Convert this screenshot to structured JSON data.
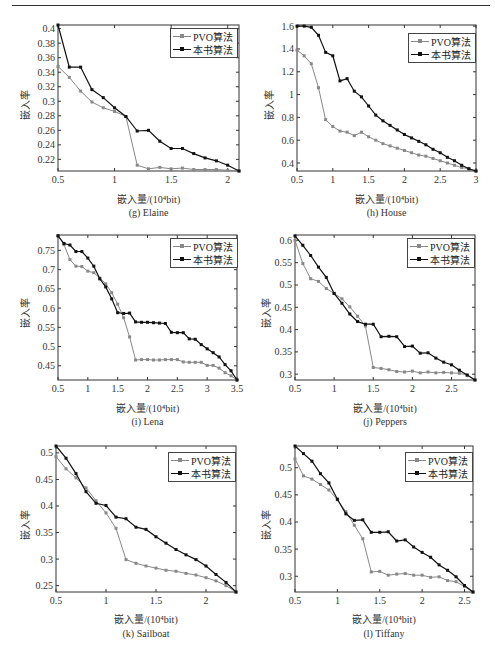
{
  "page": {
    "top_rule": true
  },
  "common": {
    "xlabel": "嵌入量/(10⁴bit)",
    "ylabel": "嵌入率",
    "legend": [
      "PVO算法",
      "本书算法"
    ],
    "colors": {
      "pvo": "#888888",
      "ours": "#111111"
    }
  },
  "chart_data": [
    {
      "id": "elaine",
      "type": "line",
      "title": "(g) Elaine",
      "xlabel": "嵌入量/(10⁴bit)",
      "ylabel": "嵌入率",
      "xlim": [
        0.5,
        2.1
      ],
      "ylim": [
        0.204,
        0.405
      ],
      "xticks": [
        0.5,
        1,
        1.5,
        2
      ],
      "xtick_labels": [
        "0.5",
        "1",
        "1.5",
        "2"
      ],
      "yticks": [
        0.22,
        0.24,
        0.26,
        0.28,
        0.3,
        0.32,
        0.34,
        0.36,
        0.38,
        0.4
      ],
      "ytick_labels": [
        "0.22",
        "0.24",
        "0.26",
        "0.28",
        "0.3",
        "0.32",
        "0.34",
        "0.36",
        "0.38",
        "0.4"
      ],
      "legend_position": "upper right",
      "grid": false,
      "x": [
        0.5,
        0.6,
        0.7,
        0.8,
        0.9,
        1.0,
        1.1,
        1.2,
        1.3,
        1.4,
        1.5,
        1.6,
        1.7,
        1.8,
        1.9,
        2.0,
        2.1
      ],
      "series": [
        {
          "name": "PVO算法",
          "values": [
            0.348,
            0.333,
            0.314,
            0.299,
            0.291,
            0.286,
            0.279,
            0.212,
            0.207,
            0.209,
            0.207,
            0.208,
            0.206,
            0.206,
            0.206,
            0.205,
            0.204
          ]
        },
        {
          "name": "本书算法",
          "values": [
            0.405,
            0.347,
            0.347,
            0.316,
            0.305,
            0.291,
            0.279,
            0.259,
            0.26,
            0.245,
            0.235,
            0.235,
            0.228,
            0.222,
            0.218,
            0.212,
            0.204
          ]
        }
      ]
    },
    {
      "id": "house",
      "type": "line",
      "title": "(h) House",
      "xlabel": "嵌入量/(10⁴bit)",
      "ylabel": "嵌入率",
      "xlim": [
        0.5,
        3.0
      ],
      "ylim": [
        0.33,
        1.61
      ],
      "xticks": [
        0.5,
        1,
        1.5,
        2,
        2.5,
        3
      ],
      "xtick_labels": [
        "0.5",
        "1",
        "1.5",
        "2",
        "2.5",
        "3"
      ],
      "yticks": [
        0.4,
        0.6,
        0.8,
        1.0,
        1.2,
        1.4,
        1.6
      ],
      "ytick_labels": [
        "0.4",
        "0.6",
        "0.8",
        "1",
        "1.2",
        "1.4",
        "1.6"
      ],
      "legend_position": "upper right",
      "grid": false,
      "x": [
        0.5,
        0.6,
        0.7,
        0.8,
        0.9,
        1.0,
        1.1,
        1.2,
        1.3,
        1.4,
        1.5,
        1.6,
        1.7,
        1.8,
        1.9,
        2.0,
        2.1,
        2.2,
        2.3,
        2.4,
        2.5,
        2.6,
        2.7,
        2.8,
        2.9,
        3.0
      ],
      "series": [
        {
          "name": "PVO算法",
          "values": [
            1.39,
            1.34,
            1.27,
            1.06,
            0.78,
            0.72,
            0.68,
            0.67,
            0.64,
            0.67,
            0.63,
            0.6,
            0.57,
            0.55,
            0.53,
            0.51,
            0.49,
            0.47,
            0.46,
            0.44,
            0.42,
            0.4,
            0.38,
            0.36,
            0.35,
            0.33
          ]
        },
        {
          "name": "本书算法",
          "values": [
            1.6,
            1.6,
            1.59,
            1.52,
            1.37,
            1.34,
            1.12,
            1.14,
            1.03,
            0.98,
            0.9,
            0.82,
            0.77,
            0.73,
            0.69,
            0.65,
            0.62,
            0.59,
            0.56,
            0.52,
            0.49,
            0.45,
            0.42,
            0.38,
            0.35,
            0.33
          ]
        }
      ]
    },
    {
      "id": "lena",
      "type": "line",
      "title": "(i) Lena",
      "xlabel": "嵌入量/(10⁴bit)",
      "ylabel": "嵌入率",
      "xlim": [
        0.5,
        3.5
      ],
      "ylim": [
        0.413,
        0.79
      ],
      "xticks": [
        0.5,
        1,
        1.5,
        2,
        2.5,
        3,
        3.5
      ],
      "xtick_labels": [
        "0.5",
        "1",
        "1.5",
        "2",
        "2.5",
        "3",
        "3.5"
      ],
      "yticks": [
        0.45,
        0.5,
        0.55,
        0.6,
        0.65,
        0.7,
        0.75
      ],
      "ytick_labels": [
        "0.45",
        "0.5",
        "0.55",
        "0.6",
        "0.65",
        "0.7",
        "0.75"
      ],
      "legend_position": "upper right",
      "grid": false,
      "x": [
        0.5,
        0.6,
        0.7,
        0.8,
        0.9,
        1.0,
        1.1,
        1.2,
        1.3,
        1.4,
        1.5,
        1.6,
        1.7,
        1.8,
        1.9,
        2.0,
        2.1,
        2.2,
        2.3,
        2.4,
        2.5,
        2.6,
        2.7,
        2.8,
        2.9,
        3.0,
        3.1,
        3.2,
        3.3,
        3.4,
        3.5
      ],
      "series": [
        {
          "name": "PVO算法",
          "values": [
            0.788,
            0.765,
            0.726,
            0.709,
            0.708,
            0.696,
            0.692,
            0.678,
            0.663,
            0.64,
            0.61,
            0.575,
            0.525,
            0.465,
            0.466,
            0.466,
            0.465,
            0.465,
            0.466,
            0.466,
            0.466,
            0.46,
            0.459,
            0.459,
            0.459,
            0.451,
            0.451,
            0.444,
            0.432,
            0.424,
            0.413
          ]
        },
        {
          "name": "本书算法",
          "values": [
            0.788,
            0.768,
            0.764,
            0.747,
            0.747,
            0.73,
            0.709,
            0.676,
            0.655,
            0.624,
            0.588,
            0.586,
            0.587,
            0.564,
            0.563,
            0.563,
            0.562,
            0.561,
            0.56,
            0.537,
            0.536,
            0.536,
            0.52,
            0.519,
            0.505,
            0.494,
            0.484,
            0.473,
            0.453,
            0.437,
            0.413
          ]
        }
      ]
    },
    {
      "id": "peppers",
      "type": "line",
      "title": "(j) Peppers",
      "xlabel": "嵌入量/(10⁴bit)",
      "ylabel": "嵌入率",
      "xlim": [
        0.5,
        2.8
      ],
      "ylim": [
        0.287,
        0.612
      ],
      "xticks": [
        0.5,
        1,
        1.5,
        2,
        2.5
      ],
      "xtick_labels": [
        "0.5",
        "1",
        "1.5",
        "2",
        "2.5"
      ],
      "yticks": [
        0.3,
        0.35,
        0.4,
        0.45,
        0.5,
        0.55,
        0.6
      ],
      "ytick_labels": [
        "0.3",
        "0.35",
        "0.4",
        "0.45",
        "0.5",
        "0.55",
        "0.6"
      ],
      "legend_position": "upper right",
      "grid": false,
      "x": [
        0.5,
        0.6,
        0.7,
        0.8,
        0.9,
        1.0,
        1.1,
        1.2,
        1.3,
        1.4,
        1.5,
        1.6,
        1.7,
        1.8,
        1.9,
        2.0,
        2.1,
        2.2,
        2.3,
        2.4,
        2.5,
        2.6,
        2.7,
        2.8
      ],
      "series": [
        {
          "name": "PVO算法",
          "values": [
            0.6,
            0.548,
            0.514,
            0.508,
            0.492,
            0.481,
            0.469,
            0.451,
            0.43,
            0.408,
            0.315,
            0.313,
            0.31,
            0.306,
            0.305,
            0.307,
            0.303,
            0.305,
            0.303,
            0.304,
            0.303,
            0.302,
            0.298,
            0.287
          ]
        },
        {
          "name": "本书算法",
          "values": [
            0.61,
            0.589,
            0.566,
            0.54,
            0.517,
            0.481,
            0.459,
            0.435,
            0.418,
            0.412,
            0.412,
            0.384,
            0.385,
            0.384,
            0.362,
            0.363,
            0.347,
            0.348,
            0.336,
            0.327,
            0.321,
            0.309,
            0.298,
            0.287
          ]
        }
      ]
    },
    {
      "id": "sailboat",
      "type": "line",
      "title": "(k) Sailboat",
      "xlabel": "嵌入量/(10⁴bit)",
      "ylabel": "嵌入率",
      "xlim": [
        0.5,
        2.3
      ],
      "ylim": [
        0.238,
        0.513
      ],
      "xticks": [
        0.5,
        1,
        1.5,
        2
      ],
      "xtick_labels": [
        "0.5",
        "1",
        "1.5",
        "2"
      ],
      "yticks": [
        0.25,
        0.3,
        0.35,
        0.4,
        0.45,
        0.5
      ],
      "ytick_labels": [
        "0.25",
        "0.3",
        "0.35",
        "0.4",
        "0.45",
        "0.5"
      ],
      "legend_position": "upper right",
      "grid": false,
      "x": [
        0.5,
        0.6,
        0.7,
        0.8,
        0.9,
        1.0,
        1.1,
        1.2,
        1.3,
        1.4,
        1.5,
        1.6,
        1.7,
        1.8,
        1.9,
        2.0,
        2.1,
        2.2,
        2.3
      ],
      "series": [
        {
          "name": "PVO算法",
          "values": [
            0.493,
            0.47,
            0.453,
            0.434,
            0.41,
            0.387,
            0.358,
            0.299,
            0.292,
            0.287,
            0.283,
            0.279,
            0.277,
            0.273,
            0.27,
            0.265,
            0.259,
            0.25,
            0.238
          ]
        },
        {
          "name": "本书算法",
          "values": [
            0.513,
            0.49,
            0.461,
            0.427,
            0.405,
            0.401,
            0.379,
            0.376,
            0.36,
            0.356,
            0.342,
            0.33,
            0.318,
            0.308,
            0.299,
            0.287,
            0.271,
            0.256,
            0.238
          ]
        }
      ]
    },
    {
      "id": "tiffany",
      "type": "line",
      "title": "(l) Tiffany",
      "xlabel": "嵌入量/(10⁴bit)",
      "ylabel": "嵌入率",
      "xlim": [
        0.5,
        2.6
      ],
      "ylim": [
        0.271,
        0.54
      ],
      "xticks": [
        0.5,
        1,
        1.5,
        2,
        2.5
      ],
      "xtick_labels": [
        "0.5",
        "1",
        "1.5",
        "2",
        "2.5"
      ],
      "yticks": [
        0.3,
        0.35,
        0.4,
        0.45,
        0.5
      ],
      "ytick_labels": [
        "0.3",
        "0.35",
        "0.4",
        "0.45",
        "0.5"
      ],
      "legend_position": "upper right",
      "grid": false,
      "x": [
        0.5,
        0.6,
        0.7,
        0.8,
        0.9,
        1.0,
        1.1,
        1.2,
        1.3,
        1.4,
        1.5,
        1.6,
        1.7,
        1.8,
        1.9,
        2.0,
        2.1,
        2.2,
        2.3,
        2.4,
        2.5,
        2.6
      ],
      "series": [
        {
          "name": "PVO算法",
          "values": [
            0.516,
            0.485,
            0.479,
            0.469,
            0.459,
            0.441,
            0.419,
            0.394,
            0.369,
            0.308,
            0.309,
            0.302,
            0.304,
            0.305,
            0.302,
            0.302,
            0.298,
            0.299,
            0.292,
            0.29,
            0.281,
            0.271
          ]
        },
        {
          "name": "本书算法",
          "values": [
            0.54,
            0.526,
            0.512,
            0.489,
            0.472,
            0.442,
            0.415,
            0.403,
            0.404,
            0.381,
            0.381,
            0.382,
            0.365,
            0.367,
            0.354,
            0.344,
            0.335,
            0.321,
            0.311,
            0.299,
            0.283,
            0.271
          ]
        }
      ]
    }
  ]
}
